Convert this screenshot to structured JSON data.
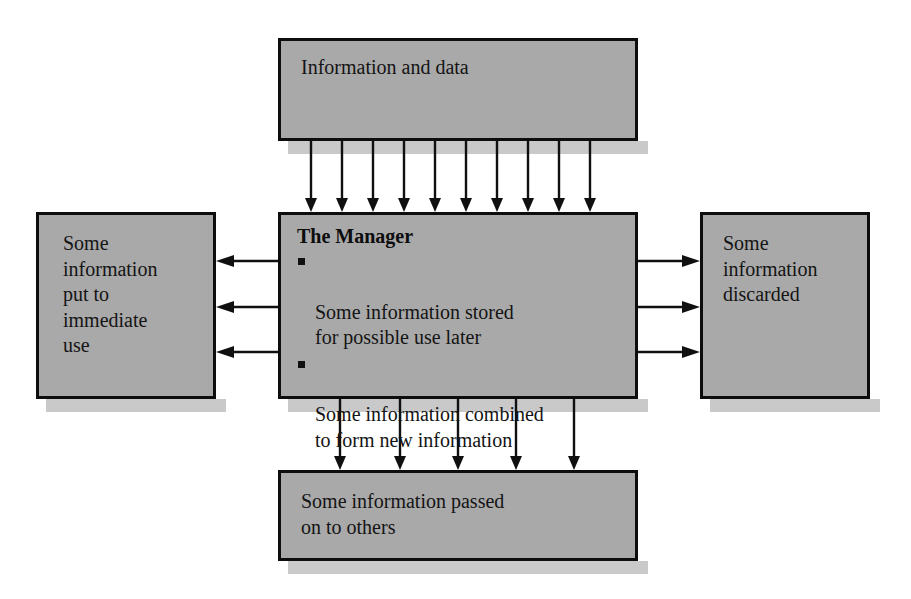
{
  "diagram": {
    "type": "flow-diagram",
    "nodes": {
      "top": {
        "label": "Information and data"
      },
      "center": {
        "title": "The Manager",
        "bullets": [
          "Some information stored\nfor possible use later",
          "Some information combined\nto form new information"
        ]
      },
      "left": {
        "label": "Some\ninformation\nput to\nimmediate\nuse"
      },
      "right": {
        "label": "Some\ninformation\ndiscarded"
      },
      "bottom": {
        "label": "Some information passed\non to others"
      }
    },
    "connections": [
      {
        "name": "input-arrows",
        "from": "top",
        "to": "center",
        "direction": "down",
        "count": 10
      },
      {
        "name": "immediate-use-arrows",
        "from": "center",
        "to": "left",
        "direction": "left",
        "count": 3
      },
      {
        "name": "discarded-arrows",
        "from": "center",
        "to": "right",
        "direction": "right",
        "count": 3
      },
      {
        "name": "passed-on-arrows",
        "from": "center",
        "to": "bottom",
        "direction": "down",
        "count": 5
      }
    ],
    "colors": {
      "box_fill": "#a9a9a9",
      "box_border": "#0d0d0d",
      "box_shadow": "#c9c9c9",
      "arrow": "#101010",
      "background": "#ffffff",
      "text": "#141414"
    }
  }
}
